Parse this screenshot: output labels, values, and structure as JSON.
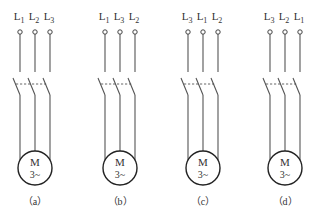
{
  "figure": {
    "colors": {
      "line": "#555555",
      "text": "#333333",
      "background": "#ffffff"
    },
    "panels": [
      {
        "id": "a",
        "caption": "（a）",
        "terminals": [
          {
            "base": "L",
            "sub": "1"
          },
          {
            "base": "L",
            "sub": "2"
          },
          {
            "base": "L",
            "sub": "3"
          }
        ],
        "motor": {
          "symbol": "M",
          "rating": "3~"
        }
      },
      {
        "id": "b",
        "caption": "（b）",
        "terminals": [
          {
            "base": "L",
            "sub": "1"
          },
          {
            "base": "L",
            "sub": "3"
          },
          {
            "base": "L",
            "sub": "2"
          }
        ],
        "motor": {
          "symbol": "M",
          "rating": "3~"
        }
      },
      {
        "id": "c",
        "caption": "（c）",
        "terminals": [
          {
            "base": "L",
            "sub": "3"
          },
          {
            "base": "L",
            "sub": "1"
          },
          {
            "base": "L",
            "sub": "2"
          }
        ],
        "motor": {
          "symbol": "M",
          "rating": "3~"
        }
      },
      {
        "id": "d",
        "caption": "（d）",
        "terminals": [
          {
            "base": "L",
            "sub": "3"
          },
          {
            "base": "L",
            "sub": "2"
          },
          {
            "base": "L",
            "sub": "1"
          }
        ],
        "motor": {
          "symbol": "M",
          "rating": "3~"
        }
      }
    ]
  }
}
